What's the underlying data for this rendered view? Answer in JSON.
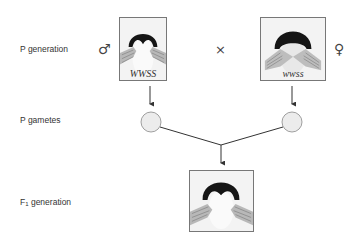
{
  "figure": {
    "rows": [
      {
        "id": "p-generation",
        "label": "P generation"
      },
      {
        "id": "p-gametes",
        "label": "P gametes"
      },
      {
        "id": "f1-generation",
        "label_main": "F",
        "label_sub": "1",
        "label_rest": " generation"
      }
    ],
    "cross_symbol": "×",
    "parents": {
      "male": {
        "sex_symbol": "♂",
        "genotype": "WWSS",
        "phenotype": "widow's peak hairline"
      },
      "female": {
        "sex_symbol": "♀",
        "genotype": "wwss",
        "phenotype": "straight hairline"
      }
    },
    "offspring": {
      "phenotype": "widow's peak hairline",
      "genotype": ""
    },
    "colors": {
      "line": "#333333",
      "gamete_fill": "#ececec",
      "gamete_stroke": "#888888",
      "frame": "#777777"
    }
  }
}
